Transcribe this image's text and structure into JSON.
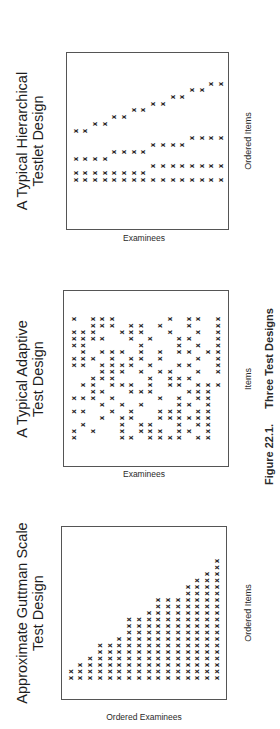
{
  "figure": {
    "caption_number": "Figure 22.1.",
    "caption_title": "Three Test Designs"
  },
  "panels": [
    {
      "id": "guttman",
      "title_line1": "Approximate Guttman Scale",
      "title_line2": "Test Design",
      "x_label": "Ordered Items",
      "y_label": "Ordered Examinees",
      "mark_symbol": "x"
    },
    {
      "id": "adaptive",
      "title_line1": "A Typical Adaptive",
      "title_line2": "Test Design",
      "x_label": "Items",
      "y_label": "Examinees",
      "mark_symbol": "x"
    },
    {
      "id": "hierarchical",
      "title_line1": "A Typical Hierarchical",
      "title_line2": "Testlet Design",
      "x_label": "Ordered Items",
      "y_label": "Examinees",
      "mark_symbol": "x"
    }
  ],
  "chart_data": [
    {
      "type": "scatter",
      "title": "Approximate Guttman Scale Test Design",
      "xlabel": "Ordered Items",
      "ylabel": "Ordered Examinees",
      "description": "Triangular pattern: number of examinees responding grows with item order",
      "column_heights": [
        2,
        3,
        4,
        6,
        6,
        7,
        10,
        10,
        11,
        13,
        13,
        13,
        15,
        16,
        17,
        19
      ]
    },
    {
      "type": "scatter",
      "title": "A Typical Adaptive Test Design",
      "xlabel": "Items",
      "ylabel": "Examinees",
      "description": "Scattered, irregular pattern of item administrations",
      "rows": [
        [
          0,
          2,
          3,
          4,
          10,
          12,
          13,
          15
        ],
        [
          2,
          3,
          4,
          6,
          7,
          9,
          12,
          15
        ],
        [
          0,
          1,
          2,
          5,
          6,
          7,
          10,
          13,
          15
        ],
        [
          0,
          1,
          2,
          3,
          6,
          8,
          11,
          12,
          15
        ],
        [
          0,
          1,
          7,
          11,
          13,
          15
        ],
        [
          1,
          3,
          4,
          5,
          7,
          9,
          11,
          12,
          14,
          15
        ],
        [
          0,
          1,
          2,
          4,
          6,
          7,
          9,
          13,
          15
        ],
        [
          0,
          1,
          3,
          4,
          5,
          6,
          8,
          11,
          12,
          15
        ],
        [
          3,
          4,
          5,
          7,
          9,
          10,
          13,
          15
        ],
        [
          2,
          3,
          4,
          8,
          10,
          11,
          12
        ],
        [
          1,
          2,
          4,
          5,
          6,
          8,
          10,
          11,
          13,
          14,
          15
        ],
        [
          2,
          3,
          6,
          7,
          8,
          12,
          13,
          14
        ],
        [
          0,
          1,
          2,
          4,
          9,
          11,
          13,
          14
        ],
        [
          3,
          5,
          7,
          11,
          12,
          14
        ],
        [
          0,
          1,
          4,
          6,
          9,
          10,
          11,
          13,
          14
        ],
        [
          3,
          5,
          6,
          9,
          10,
          11,
          12,
          13,
          14
        ],
        [
          1,
          5,
          7,
          8,
          11,
          13,
          14
        ],
        [
          0,
          2,
          5,
          7,
          8,
          9,
          11,
          12,
          14
        ],
        [
          0,
          5,
          6,
          8,
          9,
          10,
          11,
          13,
          14
        ]
      ]
    },
    {
      "type": "scatter",
      "title": "A Typical Hierarchical Testlet Design",
      "xlabel": "Ordered Items",
      "ylabel": "Examinees",
      "description": "Hierarchical testlet structure with 16 ordered items; levels branch in groups of 16, 8, 4, 2",
      "levels": [
        {
          "level": 1,
          "groups_of": 16,
          "offsets": [
            0
          ]
        },
        {
          "level": 2,
          "groups_of": 8,
          "offsets": [
            0,
            1
          ]
        },
        {
          "level": 3,
          "groups_of": 4,
          "offsets": [
            0,
            1,
            2,
            3
          ]
        },
        {
          "level": 4,
          "groups_of": 2,
          "offsets": [
            0,
            1,
            2,
            3,
            4,
            5,
            6,
            7
          ]
        }
      ]
    }
  ]
}
